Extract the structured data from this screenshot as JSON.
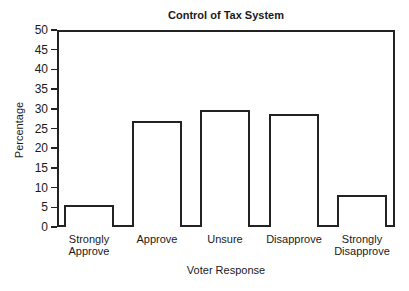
{
  "chart_data": {
    "type": "bar",
    "title": "Control of Tax System",
    "xlabel": "Voter Response",
    "ylabel": "Percentage",
    "categories": [
      "Strongly Approve",
      "Approve",
      "Unsure",
      "Disapprove",
      "Strongly Disapprove"
    ],
    "category_lines": [
      [
        "Strongly",
        "Approve"
      ],
      [
        "Approve"
      ],
      [
        "Unsure"
      ],
      [
        "Disapprove"
      ],
      [
        "Strongly",
        "Disapprove"
      ]
    ],
    "values": [
      5.5,
      27,
      29.7,
      28.8,
      8
    ],
    "ylim": [
      0,
      50
    ],
    "yticks": [
      0,
      5,
      10,
      15,
      20,
      25,
      30,
      35,
      40,
      45,
      50
    ],
    "grid": false,
    "legend": null,
    "bar_fill": "#ffffff",
    "bar_edge": "#222222"
  }
}
